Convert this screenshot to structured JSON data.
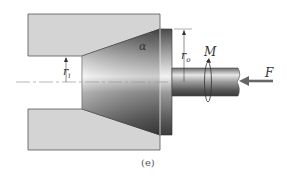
{
  "diagram": {
    "type": "mechanical-cross-section",
    "caption": "(e)",
    "labels": {
      "alpha": "α",
      "r_i_main": "r",
      "r_i_sub": "i",
      "r_o_main": "r",
      "r_o_sub": "o",
      "moment": "M",
      "force": "F"
    },
    "colors": {
      "die_fill": "#d4d4d4",
      "die_stroke": "#555555",
      "cone_dark": "#5a5a5a",
      "cone_light": "#f0f0f0",
      "centerline": "#999999",
      "arrow": "#666666"
    }
  }
}
